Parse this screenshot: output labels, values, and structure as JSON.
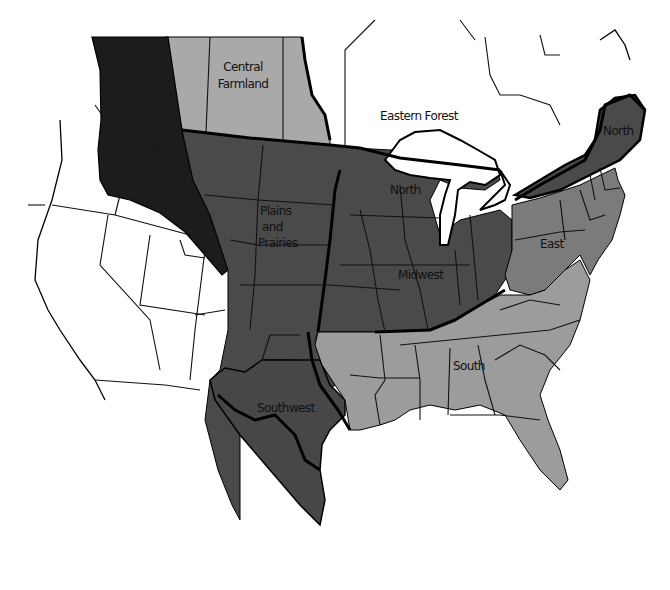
{
  "map": {
    "title": "Regional map of North America",
    "regions": [
      {
        "id": "central-farmland",
        "label_lines": [
          "Central",
          "Farmland"
        ],
        "fill": "#a9a9a9"
      },
      {
        "id": "eastern-forest",
        "label_lines": [
          "Eastern Forest"
        ],
        "fill": "#ffffff"
      },
      {
        "id": "northwest",
        "label_lines": [
          "Northwest"
        ],
        "fill": "#1c1c1c"
      },
      {
        "id": "plains-and-prairies",
        "label_lines": [
          "Plains",
          "and",
          "Prairies"
        ],
        "fill": "#4a4a4a"
      },
      {
        "id": "north-west-lakes",
        "label_lines": [
          "North"
        ],
        "fill": "#4a4a4a"
      },
      {
        "id": "north-new-england",
        "label_lines": [
          "North"
        ],
        "fill": "#4a4a4a"
      },
      {
        "id": "midwest",
        "label_lines": [
          "Midwest"
        ],
        "fill": "#4a4a4a"
      },
      {
        "id": "east",
        "label_lines": [
          "East"
        ],
        "fill": "#7b7b7b"
      },
      {
        "id": "south",
        "label_lines": [
          "South"
        ],
        "fill": "#9c9c9c"
      },
      {
        "id": "southwest",
        "label_lines": [
          "Southwest"
        ],
        "fill": "#474747"
      }
    ],
    "colors": {
      "background": "#ffffff",
      "northwest": "#1c1c1c",
      "dark_region": "#4a4a4a",
      "east": "#7b7b7b",
      "south": "#9c9c9c",
      "central_farmland": "#a9a9a9",
      "borders": "#000000"
    }
  }
}
